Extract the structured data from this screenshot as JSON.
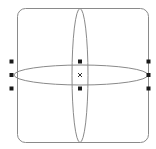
{
  "canvas": {
    "width": 156,
    "height": 149,
    "background": "#ffffff"
  },
  "colors": {
    "stroke": "#8a8a8a",
    "handle": "#1a1a1a",
    "center_marker": "#333333"
  },
  "shapes": {
    "rounded_rect": {
      "x": 17.5,
      "y": 8.5,
      "width": 131,
      "height": 134,
      "rx": 8
    },
    "vertical_ellipse": {
      "cx": 80,
      "cy": 75.5,
      "rx": 8,
      "ry": 67
    },
    "horizontal_ellipse": {
      "cx": 81,
      "cy": 75,
      "rx": 67,
      "ry": 10
    }
  },
  "selection": {
    "handles": [
      {
        "name": "handle-top-left",
        "x": 11.5,
        "y": 61.5
      },
      {
        "name": "handle-middle-left",
        "x": 11.5,
        "y": 75
      },
      {
        "name": "handle-bottom-left",
        "x": 11.5,
        "y": 88.5
      },
      {
        "name": "handle-top-center",
        "x": 80,
        "y": 61.5
      },
      {
        "name": "handle-bottom-center",
        "x": 80,
        "y": 88.5
      },
      {
        "name": "handle-top-right",
        "x": 148.5,
        "y": 61.5
      },
      {
        "name": "handle-middle-right",
        "x": 148.5,
        "y": 75
      },
      {
        "name": "handle-bottom-right",
        "x": 148.5,
        "y": 88.5
      }
    ],
    "handle_size": 4,
    "center_marker": {
      "glyph": "×",
      "x": 80,
      "y": 75
    }
  }
}
